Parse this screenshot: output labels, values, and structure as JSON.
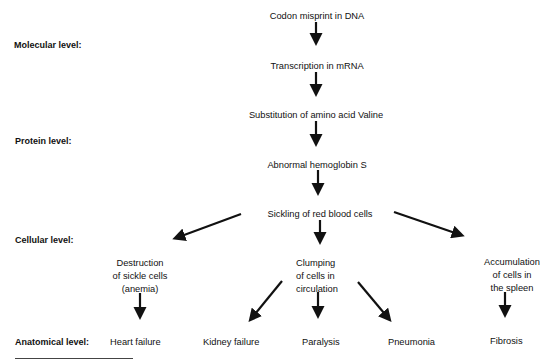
{
  "levels": {
    "molecular": "Molecular level:",
    "protein": "Protein level:",
    "cellular": "Cellular level:",
    "anatomical": "Anatomical level:"
  },
  "nodes": {
    "codon": "Codon misprint in DNA",
    "transcription": "Transcription in mRNA",
    "substitution": "Substitution of amino acid Valine",
    "hemoglobin": "Abnormal hemoglobin S",
    "sickling": "Sickling of red blood cells",
    "destruction": "Destruction\nof sickle cells\n(anemia)",
    "clumping": "Clumping\nof cells in\ncirculation",
    "accumulation": "Accumulation\nof cells in\nthe spleen"
  },
  "outcomes": [
    "Heart failure",
    "Kidney failure",
    "Paralysis",
    "Pneumonia",
    "Fibrosis"
  ],
  "edges": [
    [
      "codon",
      "transcription"
    ],
    [
      "transcription",
      "substitution"
    ],
    [
      "substitution",
      "hemoglobin"
    ],
    [
      "hemoglobin",
      "sickling"
    ],
    [
      "sickling",
      "destruction"
    ],
    [
      "sickling",
      "clumping"
    ],
    [
      "sickling",
      "accumulation"
    ],
    [
      "destruction",
      "Heart failure"
    ],
    [
      "clumping",
      "Kidney failure"
    ],
    [
      "clumping",
      "Paralysis"
    ],
    [
      "clumping",
      "Pneumonia"
    ],
    [
      "accumulation",
      "Fibrosis"
    ]
  ],
  "colors": {
    "ink": "#111111",
    "background": "#ffffff"
  }
}
